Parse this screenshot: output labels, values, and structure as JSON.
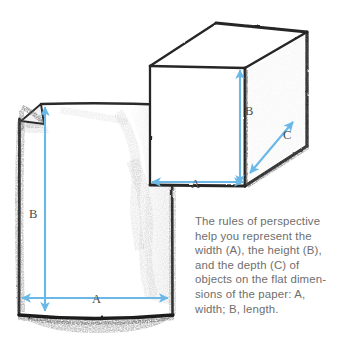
{
  "scene": {
    "title": "Perspective rules: box and sheet of paper",
    "medium": "pencil sketch",
    "background_color": "#ffffff"
  },
  "colors": {
    "arrow_blue": "#69b8e8",
    "pencil_dark": "#2b2b2b",
    "pencil_mid": "#5d5d5d",
    "pencil_light": "#b9b9b9",
    "caption_gray": "#6e6e6e",
    "label_gray": "#4a4a4a",
    "paper_fill": "#ffffff"
  },
  "caption": {
    "text": "The rules of perspective\nhelp you represent the\nwidth (A), the height (B),\nand the depth (C) of\nobjects on the flat dimen-\nsions of the paper: A,\nwidth; B, length.",
    "lines": [
      "The rules of perspective",
      "help you represent the",
      "width (A), the height (B),",
      "and the depth (C) of",
      "objects on the flat dimen-",
      "sions of the paper: A,",
      "width; B, length."
    ]
  },
  "cube": {
    "name": "three-dimensional box",
    "dimensions": [
      {
        "label": "A",
        "meaning": "width",
        "orientation": "horizontal"
      },
      {
        "label": "B",
        "meaning": "height",
        "orientation": "vertical"
      },
      {
        "label": "C",
        "meaning": "depth",
        "orientation": "diagonal"
      }
    ]
  },
  "paper": {
    "name": "sheet of paper with folded corner",
    "dimensions": [
      {
        "label": "A",
        "meaning": "width",
        "orientation": "horizontal"
      },
      {
        "label": "B",
        "meaning": "length",
        "orientation": "vertical"
      }
    ]
  }
}
